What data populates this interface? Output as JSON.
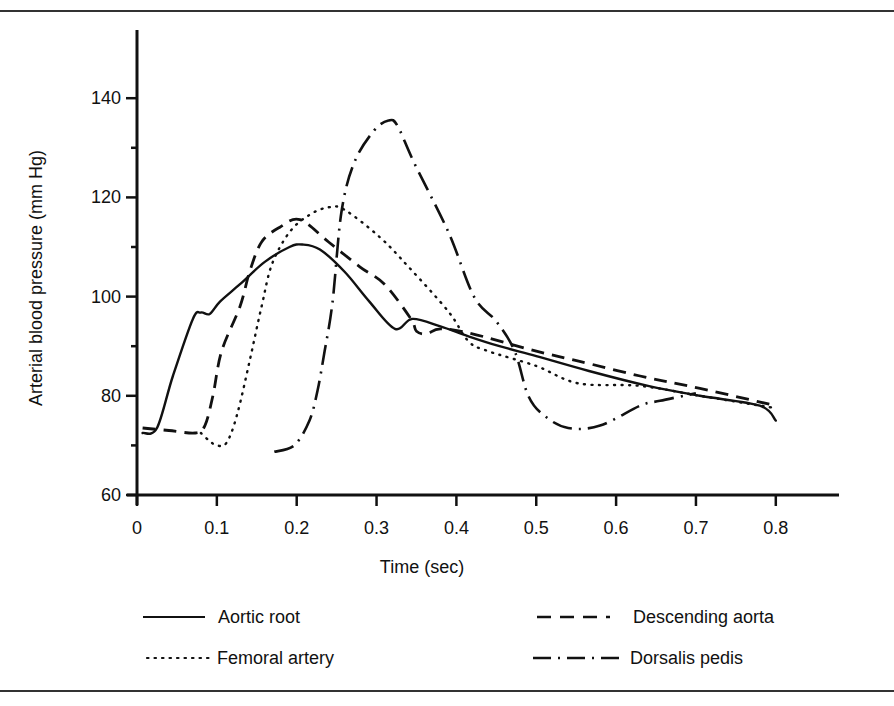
{
  "chart_data": {
    "type": "line",
    "title": "",
    "xlabel": "Time (sec)",
    "ylabel": "Arterial blood pressure (mm Hg)",
    "xlim": [
      0,
      0.8
    ],
    "ylim": [
      60,
      150
    ],
    "x_ticks": [
      "0",
      "0.1",
      "0.2",
      "0.3",
      "0.4",
      "0.5",
      "0.6",
      "0.7",
      "0.8"
    ],
    "y_ticks": [
      "60",
      "80",
      "100",
      "120",
      "140"
    ],
    "y_minor_ticks": [
      70,
      90,
      110,
      130
    ],
    "grid": false,
    "legend_position": "bottom",
    "series": [
      {
        "name": "Aortic root",
        "style": "solid",
        "x": [
          0.007,
          0.025,
          0.045,
          0.07,
          0.08,
          0.091,
          0.104,
          0.129,
          0.16,
          0.191,
          0.207,
          0.229,
          0.26,
          0.291,
          0.323,
          0.345,
          0.38,
          0.415,
          0.454,
          0.5,
          0.566,
          0.64,
          0.705,
          0.78,
          0.8
        ],
        "y": [
          72.5,
          73.5,
          84,
          95.5,
          96.8,
          96.5,
          99,
          102.5,
          107,
          110,
          110.5,
          109.5,
          105,
          99,
          93.5,
          95.5,
          94,
          92,
          90,
          88,
          85,
          82,
          80,
          78,
          75
        ]
      },
      {
        "name": "Descending aorta",
        "style": "dashed",
        "x": [
          0.007,
          0.04,
          0.073,
          0.085,
          0.095,
          0.106,
          0.129,
          0.141,
          0.156,
          0.179,
          0.204,
          0.24,
          0.279,
          0.31,
          0.343,
          0.35,
          0.363,
          0.38,
          0.42,
          0.5,
          0.553,
          0.63,
          0.705,
          0.8
        ],
        "y": [
          73.5,
          73,
          72.5,
          74,
          80,
          89,
          98,
          105,
          111,
          114,
          115.5,
          111,
          106,
          102.5,
          95.5,
          93,
          92.5,
          93.5,
          92.5,
          89,
          87,
          84,
          81.5,
          78
        ]
      },
      {
        "name": "Femoral artery",
        "style": "dotted",
        "x": [
          0.08,
          0.09,
          0.1,
          0.112,
          0.125,
          0.141,
          0.156,
          0.169,
          0.191,
          0.216,
          0.24,
          0.26,
          0.304,
          0.34,
          0.39,
          0.415,
          0.44,
          0.5,
          0.553,
          0.63,
          0.705,
          0.8
        ],
        "y": [
          72.5,
          71,
          70,
          70.5,
          76,
          87,
          98,
          106.5,
          113,
          116.5,
          118,
          117.5,
          112,
          106,
          97,
          91,
          89,
          86,
          82.5,
          82,
          80,
          77.5
        ]
      },
      {
        "name": "Dorsalis pedis",
        "style": "dash-dot",
        "x": [
          0.172,
          0.197,
          0.216,
          0.226,
          0.235,
          0.245,
          0.256,
          0.272,
          0.297,
          0.315,
          0.326,
          0.347,
          0.39,
          0.422,
          0.45,
          0.473,
          0.49,
          0.51,
          0.54,
          0.58,
          0.63,
          0.655,
          0.7
        ],
        "y": [
          68.7,
          70,
          75,
          81,
          89,
          99,
          117,
          127,
          133.5,
          135.5,
          134.5,
          127,
          113,
          100,
          95,
          89,
          80,
          76,
          73.5,
          74,
          78,
          79,
          80.5
        ]
      }
    ]
  },
  "axes": {
    "x_title": "Time (sec)",
    "y_title": "Arterial blood pressure (mm Hg)"
  },
  "legend": {
    "items": [
      {
        "label": "Aortic root",
        "style": "solid"
      },
      {
        "label": "Descending aorta",
        "style": "dashed"
      },
      {
        "label": "Femoral artery",
        "style": "dotted"
      },
      {
        "label": "Dorsalis pedis",
        "style": "dash-dot"
      }
    ]
  },
  "colors": {
    "ink": "#111111",
    "rule": "#333333",
    "background": "#ffffff"
  }
}
